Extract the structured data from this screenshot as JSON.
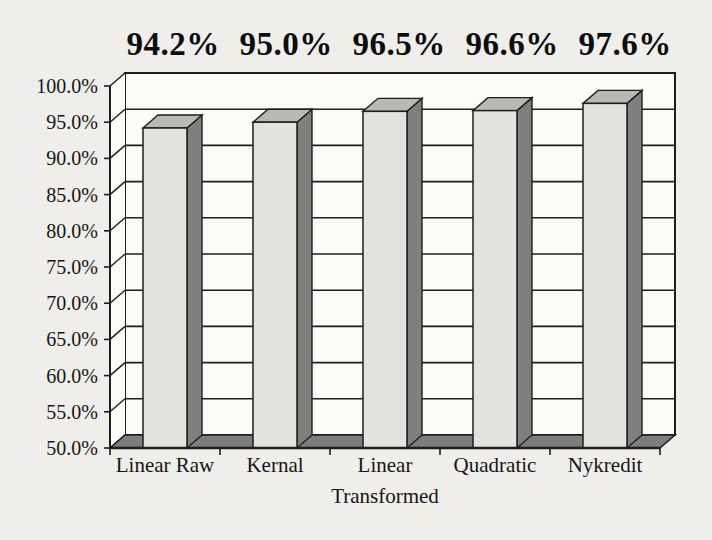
{
  "chart_data": {
    "type": "bar",
    "projection": "3d-column",
    "title_text": "94.2% 95.0% 96.5% 96.6% 97.6%",
    "categories": [
      "Linear Raw",
      "Kernal",
      "Linear",
      "Quadratic",
      "Nykredit"
    ],
    "values": [
      94.2,
      95.0,
      96.5,
      96.6,
      97.6
    ],
    "value_labels": [
      "94.2%",
      "95.0%",
      "96.5%",
      "96.6%",
      "97.6%"
    ],
    "xlabel": "Transformed",
    "ylabel": "",
    "ylim": [
      50,
      100
    ],
    "ytick_step": 5,
    "ytick_labels": [
      "50.0%",
      "55.0%",
      "60.0%",
      "65.0%",
      "70.0%",
      "75.0%",
      "80.0%",
      "85.0%",
      "90.0%",
      "95.0%",
      "100.0%"
    ],
    "grid": true,
    "legend": false,
    "colors": {
      "background": "#efeeea",
      "plot_wall": "#fcfbf8",
      "bar_front": "#e3e2df",
      "bar_top": "#b9b8b5",
      "bar_side": "#807f7d",
      "floor": "#7e7d7b",
      "line": "#1e1e1e",
      "text": "#161616"
    }
  }
}
